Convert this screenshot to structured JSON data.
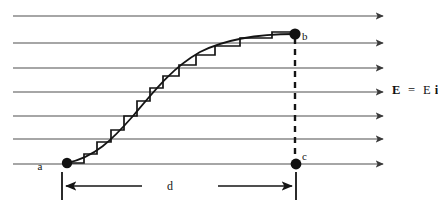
{
  "figure": {
    "kind": "physics-diagram",
    "background_color": "#ffffff",
    "ink_color": "#141414",
    "field_line_color": "#555555"
  },
  "field": {
    "label_text": "E = Ei",
    "label_vector_symbol": "E",
    "label_equals": "=",
    "label_magnitude": "E",
    "label_unit_vector": "i",
    "label_x": 392,
    "label_y": 94,
    "arrow_color": "#444444",
    "line_start_x": 13,
    "line_end_x": 383,
    "line_ys": [
      16,
      43,
      68,
      92,
      116,
      139,
      164
    ],
    "count": 7
  },
  "points": [
    {
      "id": "a",
      "label": "a",
      "x": 67,
      "y": 163,
      "label_x": 40,
      "label_y": 170,
      "radius": 5.2
    },
    {
      "id": "b",
      "label": "b",
      "x": 295,
      "y": 34,
      "label_x": 302,
      "label_y": 40,
      "radius": 5.6
    },
    {
      "id": "c",
      "label": "c",
      "x": 296,
      "y": 164,
      "label_x": 302,
      "label_y": 160,
      "radius": 5.4
    }
  ],
  "smooth_path": {
    "name": "curved-path-a-to-b",
    "d": "M 67 163 C 95 157, 112 140, 133 116 C 155 90, 172 68, 200 52 C 228 38, 262 34, 295 34"
  },
  "staircase_path": {
    "name": "staircase-approximation",
    "d": "M 67 163 L 84 163 L 84 154 L 97 154 L 97 142 L 111 142 L 111 130 L 124 130 L 124 116 L 137 116 L 137 101 L 150 101 L 150 88 L 163 88 L 163 76 L 179 76 L 179 65 L 196 65 L 196 55 L 215 55 L 215 46 L 240 46 L 240 38 L 272 38 L 272 32 L 295 32"
  },
  "dashed_segment": {
    "name": "dashed-line-b-to-c",
    "x": 295,
    "y_top": 38,
    "y_bottom": 160,
    "dash": "6 5",
    "width": 2.4
  },
  "dimension": {
    "label": "d",
    "label_x": 170,
    "label_y": 190,
    "baseline_y": 186,
    "tick_left_x": 62,
    "tick_right_x": 296,
    "tick_top_y": 172,
    "tick_bottom_y": 200,
    "left_arrow_from_x": 142,
    "left_arrow_to_x": 66,
    "right_arrow_from_x": 218,
    "right_arrow_to_x": 292
  }
}
